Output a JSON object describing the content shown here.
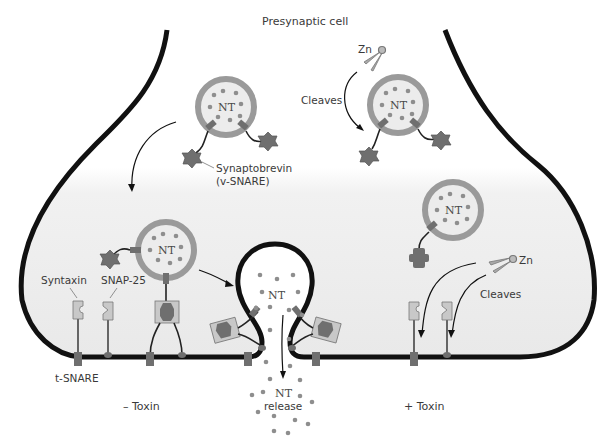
{
  "diagram": {
    "title": "Presynaptic cell",
    "colors": {
      "membrane": "#111111",
      "cytoplasm_gradient_top": "#ffffff",
      "cytoplasm_gradient_bottom": "#e8e8e8",
      "vesicle_rim": "#9a9a9a",
      "vesicle_fill": "#ececec",
      "nt_dot": "#8e8e8e",
      "protein_dark": "#6f6f6f",
      "snare_box": "#c8c8c8",
      "label_text": "#3a3a3a"
    },
    "labels": {
      "top_title": "Presynaptic cell",
      "synaptobrevin": "Synaptobrevin",
      "v_snare": "(v-SNARE)",
      "zn_top": "Zn",
      "cleaves_top": "Cleaves",
      "zn_right": "Zn",
      "cleaves_right": "Cleaves",
      "syntaxin": "Syntaxin",
      "snap25": "SNAP-25",
      "t_snare": "t-SNARE",
      "minus_toxin": "– Toxin",
      "plus_toxin": "+ Toxin",
      "nt_release_line1": "NT",
      "nt_release_line2": "release",
      "nt_pore": "NT"
    },
    "vesicles": [
      {
        "id": "top-left-vesicle",
        "label": "NT",
        "cx": 226,
        "cy": 107
      },
      {
        "id": "top-right-vesicle",
        "label": "NT",
        "cx": 398,
        "cy": 105
      },
      {
        "id": "docked-vesicle",
        "label": "NT",
        "cx": 166,
        "cy": 250
      },
      {
        "id": "right-vesicle",
        "label": "NT",
        "cx": 453,
        "cy": 210
      }
    ],
    "panels": [
      {
        "side": "left",
        "condition": "– Toxin"
      },
      {
        "side": "right",
        "condition": "+ Toxin"
      }
    ]
  }
}
